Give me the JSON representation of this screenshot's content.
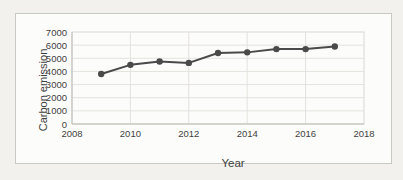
{
  "chart_data": {
    "type": "line",
    "title": "",
    "xlabel": "Year",
    "ylabel": "Carbon emission",
    "x": [
      2009,
      2010,
      2011,
      2012,
      2013,
      2014,
      2015,
      2016,
      2017
    ],
    "series": [
      {
        "name": "Carbon emission",
        "values": [
          3800,
          4500,
          4750,
          4650,
          5400,
          5450,
          5700,
          5700,
          5900
        ]
      }
    ],
    "xlim": [
      2008,
      2018
    ],
    "ylim": [
      0,
      7000
    ],
    "x_ticks": [
      2008,
      2010,
      2012,
      2014,
      2016,
      2018
    ],
    "y_ticks": [
      0,
      1000,
      2000,
      3000,
      4000,
      5000,
      6000,
      7000
    ],
    "grid": true,
    "legend_position": "none",
    "marker": "circle",
    "colors": {
      "line": "#4a4a4a",
      "marker": "#4a4a4a",
      "grid": "#e3e2dd",
      "axis": "#bdbcb7",
      "plot_border": "#d9d8d3",
      "plot_bg": "#fcfcfa",
      "tick_text": "#3f3f3f"
    }
  }
}
